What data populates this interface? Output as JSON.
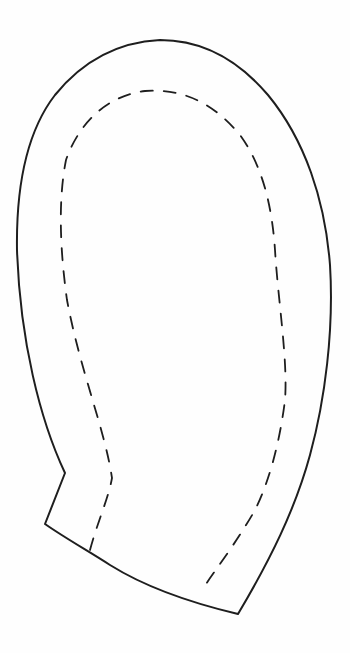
{
  "diagram": {
    "type": "sewing-pattern-piece",
    "shape": "mitten",
    "background_color": "#fefefe",
    "line_color": "#1e1e1e",
    "elements": [
      {
        "name": "cut-line",
        "style": "solid"
      },
      {
        "name": "seam-line",
        "style": "dashed"
      }
    ]
  }
}
